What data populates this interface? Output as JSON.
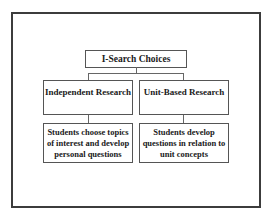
{
  "diagram": {
    "title": "I-Search Choices",
    "branches": [
      {
        "label": "Independent Research",
        "description": "Students choose topics of interest and develop personal questions"
      },
      {
        "label": "Unit-Based Research",
        "description": "Students develop questions in relation to unit concepts"
      }
    ]
  },
  "colors": {
    "frame_border": "#3c3c3c",
    "box_border": "#555555",
    "text": "#1a1a1a",
    "background": "#ffffff"
  }
}
